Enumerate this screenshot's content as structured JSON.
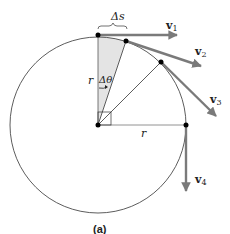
{
  "figure": {
    "caption": "(a)",
    "labels": {
      "arc_length": "Δs",
      "radius_vertical": "r",
      "radius_horizontal": "r",
      "angle": "Δθ"
    },
    "vectors": [
      {
        "name": "v",
        "sub": "1"
      },
      {
        "name": "v",
        "sub": "2"
      },
      {
        "name": "v",
        "sub": "3"
      },
      {
        "name": "v",
        "sub": "4"
      }
    ],
    "colors": {
      "circle": "#333333",
      "arrow": "#7a7a7a",
      "shade": "#e4e4e4",
      "dot": "#000000"
    }
  }
}
